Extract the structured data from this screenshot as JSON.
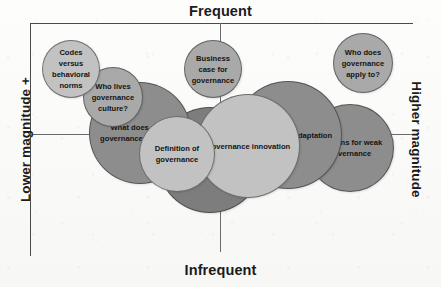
{
  "axes": {
    "top_label": "Frequent",
    "bottom_label": "Infrequent",
    "left_label": "Lower magnitude +",
    "right_label": "Higher magnitude"
  },
  "chart_data": {
    "type": "scatter",
    "title": "",
    "xlabel": "Frequency (Infrequent → Frequent)",
    "ylabel": "Magnitude (Lower magnitude + → Higher magnitude)",
    "x_axis_endpoints": [
      "Lower magnitude +",
      "Higher magnitude"
    ],
    "y_axis_endpoints": [
      "Infrequent",
      "Frequent"
    ],
    "grid": false,
    "legend": false,
    "bubbles": [
      {
        "label": "Codes versus behavioral norms",
        "cx": 71,
        "cy": 69,
        "r": 29,
        "tone": "light",
        "z": 6
      },
      {
        "label": "Who lives governance culture?",
        "cx": 113,
        "cy": 97,
        "r": 30,
        "tone": "mid",
        "z": 5
      },
      {
        "label": "What does good governance look like?",
        "cx": 140,
        "cy": 133,
        "r": 51,
        "tone": "dark",
        "z": 3
      },
      {
        "label": "Business case for governance",
        "cx": 213,
        "cy": 69,
        "r": 29,
        "tone": "mid",
        "z": 5
      },
      {
        "label": "Who does governance apply to?",
        "cx": 363,
        "cy": 63,
        "r": 30,
        "tone": "mid",
        "z": 6
      },
      {
        "label": "Learning and adaptation",
        "cx": 288,
        "cy": 135,
        "r": 54,
        "tone": "dark",
        "z": 3
      },
      {
        "label": "Reasons for weak governance",
        "cx": 350,
        "cy": 148,
        "r": 44,
        "tone": "dark",
        "z": 2
      },
      {
        "label": "Origins of governance oversight",
        "cx": 210,
        "cy": 160,
        "r": 53,
        "tone": "darker",
        "z": 1
      },
      {
        "label": "Governance innovation",
        "cx": 248,
        "cy": 146,
        "r": 52,
        "tone": "light",
        "z": 4
      },
      {
        "label": "Definition of governance",
        "cx": 177,
        "cy": 154,
        "r": 38,
        "tone": "light",
        "z": 7
      }
    ]
  }
}
